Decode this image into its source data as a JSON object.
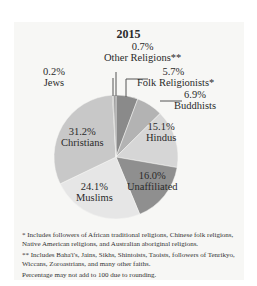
{
  "chart_data": {
    "type": "pie",
    "title": "2015",
    "slices": [
      {
        "label": "Folk Religionists*",
        "value": 5.7,
        "display": "5.7%",
        "color": "#8a8a8a"
      },
      {
        "label": "Buddhists",
        "value": 6.9,
        "display": "6.9%",
        "color": "#b3b3b3"
      },
      {
        "label": "Hindus",
        "value": 15.1,
        "display": "15.1%",
        "color": "#d6d6d6"
      },
      {
        "label": "Unaffiliated",
        "value": 16.0,
        "display": "16.0%",
        "color": "#8f8f8f"
      },
      {
        "label": "Muslims",
        "value": 24.1,
        "display": "24.1%",
        "color": "#e6e6e6"
      },
      {
        "label": "Christians",
        "value": 31.2,
        "display": "31.2%",
        "color": "#c8c8c8"
      },
      {
        "label": "Jews",
        "value": 0.2,
        "display": "0.2%",
        "color": "#7a7a7a"
      },
      {
        "label": "Other Religions**",
        "value": 0.7,
        "display": "0.7%",
        "color": "#a0a0a0"
      }
    ]
  },
  "title": "2015",
  "labels": {
    "other_pct": "0.7%",
    "other_name": "Other Religions**",
    "jews_pct": "0.2%",
    "jews_name": "Jews",
    "folk_pct": "5.7%",
    "folk_name": "Folk Religionists*",
    "buddhists_pct": "6.9%",
    "buddhists_name": "Buddhists",
    "hindus_pct": "15.1%",
    "hindus_name": "Hindus",
    "unaffiliated_pct": "16.0%",
    "unaffiliated_name": "Unaffiliated",
    "muslims_pct": "24.1%",
    "muslims_name": "Muslims",
    "christians_pct": "31.2%",
    "christians_name": "Christians"
  },
  "footnotes": {
    "note1": "* Includes followers of African traditional religions, Chinese folk religions, Native American religions, and Australian aboriginal religions.",
    "note2": "** Includes Baha'i's, Jains, Sikhs, Shintoists, Taoists, followers of Tenrikyo, Wiccans, Zoroastrians, and many other faiths.",
    "note3": "Percentage may not add to 100 due to rounding."
  }
}
